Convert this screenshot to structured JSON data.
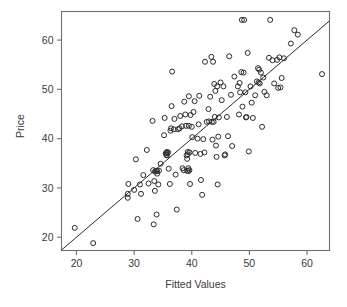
{
  "chart_data": {
    "type": "scatter",
    "title": "",
    "xlabel": "Fitted Values",
    "ylabel": "Price",
    "xlim": [
      17.4,
      63.9
    ],
    "ylim": [
      17.3,
      65.8
    ],
    "xticks": [
      20,
      30,
      40,
      50,
      60
    ],
    "yticks": [
      20,
      30,
      40,
      50,
      60
    ],
    "xtick_labels": [
      "20",
      "30",
      "40",
      "50",
      "60"
    ],
    "ytick_labels": [
      "20",
      "30",
      "40",
      "50",
      "60"
    ],
    "grid": false,
    "legend": "none",
    "marker": "open-circle",
    "marker_color": "#2b2b2b",
    "reference_line": {
      "name": "y = x identity line",
      "x": [
        17.4,
        63.9
      ],
      "y": [
        17.4,
        63.9
      ],
      "color": "#2b2b2b"
    },
    "points": [
      [
        19.7,
        21.9
      ],
      [
        22.9,
        18.8
      ],
      [
        28.9,
        28.8
      ],
      [
        28.9,
        28.0
      ],
      [
        29.0,
        30.8
      ],
      [
        30.0,
        29.6
      ],
      [
        30.3,
        35.8
      ],
      [
        30.6,
        23.7
      ],
      [
        31.0,
        30.7
      ],
      [
        31.2,
        28.8
      ],
      [
        31.6,
        32.6
      ],
      [
        32.2,
        37.7
      ],
      [
        32.5,
        30.9
      ],
      [
        33.2,
        43.6
      ],
      [
        33.3,
        33.6
      ],
      [
        33.4,
        22.6
      ],
      [
        33.5,
        31.4
      ],
      [
        33.6,
        29.4
      ],
      [
        33.6,
        33.3
      ],
      [
        33.8,
        33.5
      ],
      [
        33.9,
        24.6
      ],
      [
        34.0,
        33.4
      ],
      [
        34.0,
        32.9
      ],
      [
        34.2,
        30.7
      ],
      [
        34.3,
        33.5
      ],
      [
        34.6,
        34.9
      ],
      [
        35.2,
        40.7
      ],
      [
        35.3,
        44.2
      ],
      [
        35.5,
        37.0
      ],
      [
        35.6,
        37.1
      ],
      [
        35.6,
        36.7
      ],
      [
        35.7,
        37.3
      ],
      [
        35.7,
        36.6
      ],
      [
        35.9,
        37.2
      ],
      [
        36.0,
        33.9
      ],
      [
        36.2,
        30.8
      ],
      [
        36.3,
        41.6
      ],
      [
        36.4,
        42.1
      ],
      [
        36.5,
        46.6
      ],
      [
        36.6,
        53.6
      ],
      [
        36.9,
        41.9
      ],
      [
        37.0,
        44.0
      ],
      [
        37.2,
        32.7
      ],
      [
        37.4,
        25.6
      ],
      [
        37.6,
        41.9
      ],
      [
        37.9,
        42.1
      ],
      [
        38.0,
        44.6
      ],
      [
        38.3,
        42.5
      ],
      [
        38.4,
        34.0
      ],
      [
        38.6,
        33.6
      ],
      [
        38.7,
        47.5
      ],
      [
        38.9,
        44.9
      ],
      [
        39.0,
        42.6
      ],
      [
        39.1,
        36.6
      ],
      [
        39.2,
        35.9
      ],
      [
        39.2,
        33.5
      ],
      [
        39.3,
        37.3
      ],
      [
        39.3,
        36.8
      ],
      [
        39.4,
        34.0
      ],
      [
        39.4,
        33.4
      ],
      [
        39.5,
        48.6
      ],
      [
        39.5,
        42.6
      ],
      [
        39.6,
        37.2
      ],
      [
        39.6,
        33.6
      ],
      [
        39.7,
        30.8
      ],
      [
        39.8,
        44.8
      ],
      [
        40.0,
        42.4
      ],
      [
        40.1,
        40.3
      ],
      [
        40.3,
        45.4
      ],
      [
        40.5,
        47.6
      ],
      [
        40.6,
        37.1
      ],
      [
        41.0,
        40.0
      ],
      [
        41.2,
        42.9
      ],
      [
        41.3,
        48.7
      ],
      [
        41.5,
        36.9
      ],
      [
        41.6,
        31.6
      ],
      [
        41.8,
        28.6
      ],
      [
        42.0,
        39.9
      ],
      [
        42.2,
        37.2
      ],
      [
        42.3,
        55.6
      ],
      [
        42.6,
        43.4
      ],
      [
        42.9,
        46.0
      ],
      [
        43.0,
        43.5
      ],
      [
        43.2,
        48.5
      ],
      [
        43.4,
        56.6
      ],
      [
        43.5,
        43.4
      ],
      [
        43.6,
        39.8
      ],
      [
        43.7,
        55.6
      ],
      [
        43.8,
        43.4
      ],
      [
        43.9,
        51.1
      ],
      [
        44.0,
        44.4
      ],
      [
        44.1,
        49.7
      ],
      [
        44.2,
        38.6
      ],
      [
        44.3,
        36.3
      ],
      [
        44.4,
        50.6
      ],
      [
        44.5,
        30.7
      ],
      [
        44.6,
        40.4
      ],
      [
        44.7,
        44.3
      ],
      [
        45.0,
        51.4
      ],
      [
        45.2,
        47.8
      ],
      [
        45.5,
        50.6
      ],
      [
        45.7,
        36.6
      ],
      [
        45.8,
        36.8
      ],
      [
        46.1,
        44.4
      ],
      [
        46.3,
        40.5
      ],
      [
        46.5,
        56.7
      ],
      [
        46.8,
        48.9
      ],
      [
        47.0,
        38.5
      ],
      [
        47.4,
        52.6
      ],
      [
        48.0,
        50.6
      ],
      [
        48.2,
        44.9
      ],
      [
        48.3,
        51.3
      ],
      [
        48.4,
        49.4
      ],
      [
        48.6,
        53.5
      ],
      [
        48.7,
        64.1
      ],
      [
        48.8,
        46.5
      ],
      [
        49.0,
        53.4
      ],
      [
        49.1,
        64.1
      ],
      [
        49.3,
        49.4
      ],
      [
        49.4,
        44.3
      ],
      [
        49.5,
        44.4
      ],
      [
        49.7,
        57.4
      ],
      [
        49.9,
        37.4
      ],
      [
        50.2,
        50.6
      ],
      [
        50.4,
        47.3
      ],
      [
        50.6,
        44.2
      ],
      [
        51.0,
        48.8
      ],
      [
        51.3,
        51.6
      ],
      [
        51.5,
        54.3
      ],
      [
        51.6,
        51.4
      ],
      [
        51.7,
        54.0
      ],
      [
        51.8,
        51.2
      ],
      [
        52.0,
        53.4
      ],
      [
        52.2,
        42.4
      ],
      [
        52.4,
        52.4
      ],
      [
        52.6,
        49.5
      ],
      [
        53.0,
        48.8
      ],
      [
        53.4,
        56.4
      ],
      [
        53.6,
        64.1
      ],
      [
        54.0,
        55.9
      ],
      [
        54.3,
        51.2
      ],
      [
        54.8,
        56.0
      ],
      [
        55.0,
        50.3
      ],
      [
        55.2,
        56.5
      ],
      [
        55.4,
        50.4
      ],
      [
        55.6,
        52.3
      ],
      [
        56.0,
        56.3
      ],
      [
        57.2,
        59.3
      ],
      [
        57.8,
        62.0
      ],
      [
        58.4,
        61.1
      ],
      [
        62.6,
        53.1
      ]
    ]
  },
  "axes": {
    "x_title": "Fitted Values",
    "y_title": "Price"
  }
}
